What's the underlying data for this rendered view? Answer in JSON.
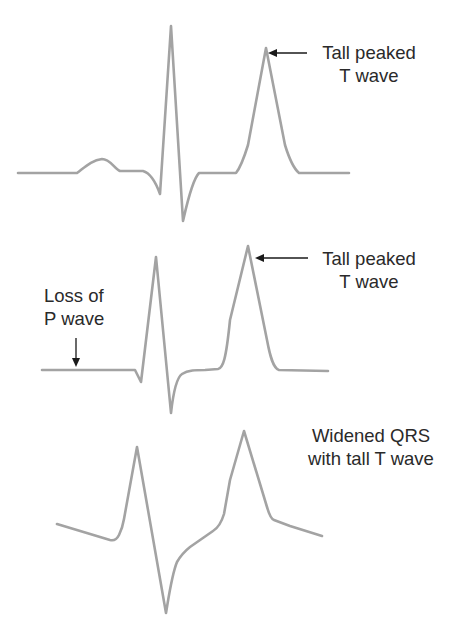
{
  "figure": {
    "panels": [
      {
        "id": "panel-1",
        "annotation": {
          "lines": [
            "Tall peaked",
            "T wave"
          ]
        },
        "pointer": "arrow-left-to-T-peak"
      },
      {
        "id": "panel-2",
        "annotation": {
          "lines": [
            "Tall peaked",
            "T wave"
          ]
        },
        "pointer": "arrow-left-to-T-peak",
        "secondary_annotation": {
          "lines": [
            "Loss of",
            "P wave"
          ]
        },
        "secondary_pointer": "arrow-down-to-baseline"
      },
      {
        "id": "panel-3",
        "annotation": {
          "lines": [
            "Widened QRS",
            "with tall T wave"
          ]
        }
      }
    ],
    "colors": {
      "trace": "#a3a3a3",
      "text": "#2a2a2a",
      "arrow": "#1a1a1a",
      "background": "#ffffff"
    }
  }
}
